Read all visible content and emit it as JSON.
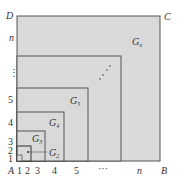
{
  "corners": {
    "A": "A",
    "B": "B",
    "C": "C",
    "D": "D"
  },
  "x_ticks": [
    "1",
    "2",
    "3",
    "4",
    "5",
    "···",
    "n"
  ],
  "y_ticks": [
    "1",
    "2",
    "3",
    "4",
    "5",
    "⋮",
    "n"
  ],
  "regions": {
    "g2": "G",
    "g2_sub": "2",
    "g3": "G",
    "g3_sub": "3",
    "g4": "G",
    "g4_sub": "4",
    "g5": "G",
    "g5_sub": "5",
    "gn": "G",
    "gn_sub": "n"
  },
  "colors": {
    "fill": "#d9d9d9",
    "stroke": "#555555"
  }
}
